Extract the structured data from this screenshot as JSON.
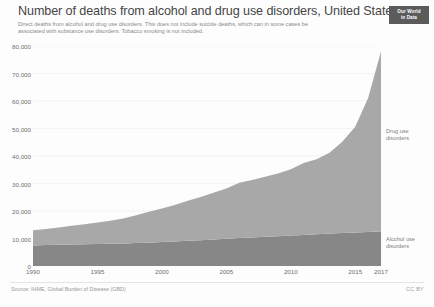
{
  "header": {
    "title": "Number of deaths from alcohol and drug use disorders, United States",
    "subtitle": "Direct deaths from alcohol and drug use disorders. This does not include suicide deaths, which can in some cases be associated with substance use disorders. Tobacco smoking is not included.",
    "logo_line1": "Our World",
    "logo_line2": "in Data"
  },
  "footer": {
    "source": "Source: IHME, Global Burden of Disease (GBD)",
    "license": "CC BY"
  },
  "colors": {
    "drug_use": "#a8a8a8",
    "alcohol_use": "#878787",
    "gridline": "#ececec",
    "axis_text": "#6f6f6f",
    "title_text": "#454545",
    "subtitle_text": "#8a8a8a",
    "logo_background": "#5b5b5b",
    "page_background": "#fdfdfd"
  },
  "chart_data": {
    "type": "area",
    "stacked": true,
    "title": "Number of deaths from alcohol and drug use disorders, United States",
    "xlabel": "",
    "ylabel": "",
    "xlim": [
      1990,
      2017
    ],
    "ylim": [
      0,
      80000
    ],
    "grid": true,
    "legend_position": "right-inline",
    "y_ticks": [
      0,
      10000,
      20000,
      30000,
      40000,
      50000,
      60000,
      70000,
      80000
    ],
    "y_tick_labels": [
      "0",
      "10,000",
      "20,000",
      "30,000",
      "40,000",
      "50,000",
      "60,000",
      "70,000",
      "80,000"
    ],
    "x_ticks": [
      1990,
      1995,
      2000,
      2005,
      2010,
      2015,
      2017
    ],
    "x_tick_labels": [
      "1990",
      "1995",
      "2000",
      "2005",
      "2010",
      "2015",
      "2017"
    ],
    "x": [
      1990,
      1991,
      1992,
      1993,
      1994,
      1995,
      1996,
      1997,
      1998,
      1999,
      2000,
      2001,
      2002,
      2003,
      2004,
      2005,
      2006,
      2007,
      2008,
      2009,
      2010,
      2011,
      2012,
      2013,
      2014,
      2015,
      2016,
      2017
    ],
    "series": [
      {
        "name": "Alcohol use disorders",
        "color": "#878787",
        "values": [
          7500,
          7600,
          7700,
          7800,
          7900,
          8000,
          8100,
          8200,
          8350,
          8500,
          8700,
          8900,
          9150,
          9400,
          9650,
          9900,
          10150,
          10400,
          10650,
          10850,
          11050,
          11300,
          11550,
          11800,
          12000,
          12200,
          12400,
          12600
        ]
      },
      {
        "name": "Drug use disorders",
        "color": "#a8a8a8",
        "values": [
          5500,
          5900,
          6300,
          6800,
          7300,
          7800,
          8400,
          9100,
          10100,
          11200,
          12200,
          13300,
          14600,
          15700,
          17000,
          18300,
          20100,
          20900,
          21800,
          22800,
          24100,
          26200,
          27300,
          29400,
          33200,
          38400,
          48700,
          65400
        ]
      }
    ],
    "totals": [
      13000,
      13500,
      14000,
      14600,
      15200,
      15800,
      16500,
      17300,
      18450,
      19700,
      20900,
      22200,
      23750,
      25100,
      26650,
      28200,
      30250,
      31300,
      32450,
      33650,
      35150,
      37500,
      38850,
      41200,
      45200,
      50600,
      61100,
      78000
    ]
  },
  "labels": {
    "drug_use": "Drug use\ndisorders",
    "alcohol_use": "Alcohol use\ndisorders"
  }
}
